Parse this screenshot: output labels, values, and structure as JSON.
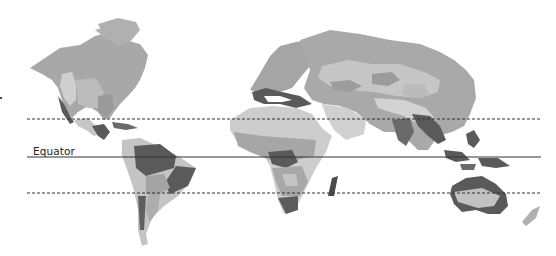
{
  "map": {
    "title": "World climate zones",
    "projection": "equirectangular",
    "lines": [
      {
        "name": "Tropic of Cancer",
        "label": "",
        "y": 119,
        "style": "dashed"
      },
      {
        "name": "Equator",
        "label": "Equator",
        "y": 157,
        "style": "solid"
      },
      {
        "name": "Tropic of Capricorn",
        "label": "",
        "y": 193,
        "style": "dashed"
      }
    ],
    "equator_label": "Equator",
    "shades": {
      "lightest": "#d6d6d6",
      "light": "#c4c4c4",
      "medium": "#adadad",
      "medium_dark": "#979797",
      "dark": "#5a5a5a",
      "line": "#333333"
    }
  }
}
